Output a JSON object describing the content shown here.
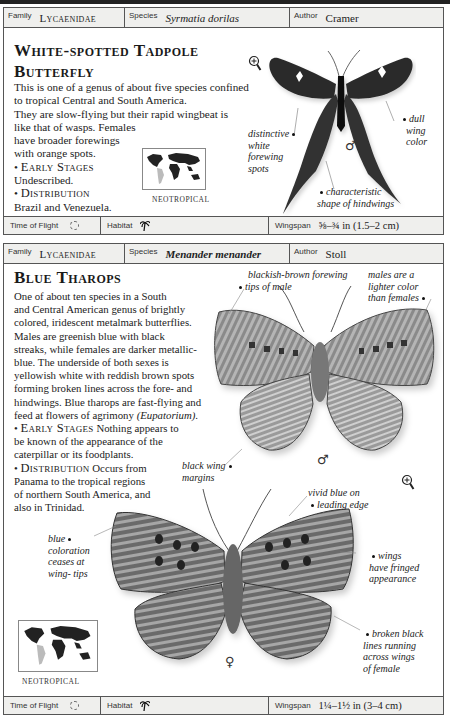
{
  "entries": [
    {
      "header": {
        "family_label": "Family",
        "family": "Lycaenidae",
        "species_label": "Species",
        "species": "Syrmatia dorilas",
        "author_label": "Author",
        "author": "Cramer"
      },
      "title_line1": "White-spotted Tadpole",
      "title_line2": "Butterfly",
      "description_lines": [
        "This is one of a genus of about five species confined",
        "to tropical Central and South America.",
        "They are slow-flying but their rapid wingbeat is",
        "like that of wasps. Females",
        "have broader forewings",
        "with orange spots."
      ],
      "early_stages_heading": "Early Stages",
      "early_stages": "Undescribed.",
      "distribution_heading": "Distribution",
      "distribution": "Brazil and Venezuela.",
      "map_caption": "NEOTROPICAL",
      "sex_symbol": "♂",
      "annotations": [
        {
          "id": "forewing-spots",
          "text": [
            "distinctive",
            "white",
            "forewing",
            "spots"
          ]
        },
        {
          "id": "wing-color",
          "text": [
            "dull",
            "wing",
            "color"
          ]
        },
        {
          "id": "hindwings",
          "text": [
            "characteristic",
            "shape of hindwings"
          ]
        }
      ],
      "footer": {
        "time_label": "Time of Flight",
        "time_icon": "sun-icon",
        "habitat_label": "Habitat",
        "habitat_icon": "palm-tree-icon",
        "wingspan_label": "Wingspan",
        "wingspan": "⅝–¾ in (1.5–2 cm)"
      }
    },
    {
      "header": {
        "family_label": "Family",
        "family": "Lycaenidae",
        "species_label": "Species",
        "species": "Menander menander",
        "author_label": "Author",
        "author": "Stoll"
      },
      "title_line1": "Blue Tharops",
      "description_lines": [
        "One of about ten species in a South",
        "and Central American genus of brightly",
        "colored, iridescent metalmark butterflies.",
        "Males are greenish blue with black",
        "streaks, while females are darker metallic-",
        "blue. The underside of both sexes is",
        "yellowish white with reddish brown spots",
        "forming broken lines across the fore- and",
        "hindwings. Blue tharops are fast-flying and"
      ],
      "description_last_prefix": "feed at flowers of agrimony ",
      "description_last_italic": "(Eupatorium).",
      "early_stages_heading": "Early Stages",
      "early_stages_lines": [
        " Nothing appears to",
        "be known of the appearance of the",
        "caterpillar or its foodplants."
      ],
      "distribution_heading": "Distribution",
      "distribution_lines": [
        " Occurs from",
        "Panama to the tropical regions",
        "of northern South America, and",
        "also in Trinidad."
      ],
      "map_caption": "NEOTROPICAL",
      "male_symbol": "♂",
      "female_symbol": "♀",
      "annotations": [
        {
          "id": "forewing-tips",
          "text": [
            "blackish-brown forewing",
            "tips of male"
          ]
        },
        {
          "id": "male-lighter",
          "text": [
            "males are a",
            "lighter color",
            "than females"
          ]
        },
        {
          "id": "black-margins",
          "text": [
            "black wing",
            "margins"
          ]
        },
        {
          "id": "vivid-blue",
          "text": [
            "vivid blue on",
            "leading edge"
          ]
        },
        {
          "id": "blue-ceases",
          "text": [
            "blue",
            "coloration",
            "ceases at",
            "wing- tips"
          ]
        },
        {
          "id": "fringed",
          "text": [
            "wings",
            "have fringed",
            "appearance"
          ]
        },
        {
          "id": "broken-lines",
          "text": [
            "broken black",
            "lines running",
            "across wings",
            "of female"
          ]
        }
      ],
      "footer": {
        "time_label": "Time of Flight",
        "time_icon": "sun-icon",
        "habitat_label": "Habitat",
        "habitat_icon": "palm-tree-icon",
        "wingspan_label": "Wingspan",
        "wingspan": "1¼–1½ in (3–4 cm)"
      }
    }
  ]
}
